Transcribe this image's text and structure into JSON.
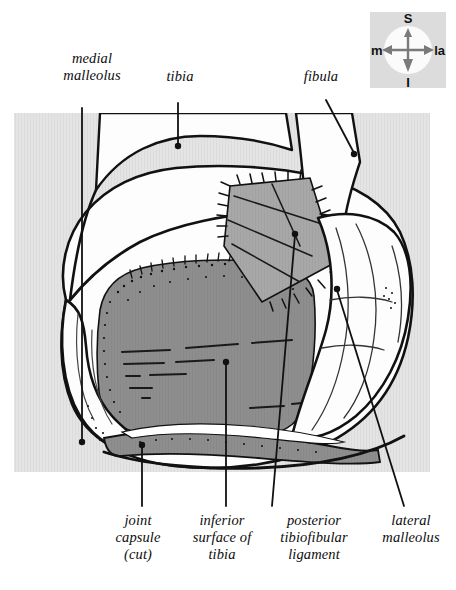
{
  "figure": {
    "panel": {
      "background_color": "#e4e4e4",
      "bone_fill_color": "#fdfdfd",
      "tibial_surface_color": "#8e8e8e",
      "ligament_color": "#a8a8a8",
      "outline_color": "#111111"
    },
    "labels": {
      "medial_malleolus": "medial\nmalleolus",
      "tibia": "tibia",
      "fibula": "fibula",
      "joint_capsule": "joint\ncapsule\n(cut)",
      "inferior_surface_of_tibia": "inferior\nsurface of\ntibia",
      "posterior_tibiofibular_ligament": "posterior\ntibiofibular\nligament",
      "lateral_malleolus": "lateral\nmalleolus"
    },
    "orientation_compass": {
      "superior": "S",
      "inferior": "I",
      "medial": "m",
      "lateral": "la"
    }
  }
}
